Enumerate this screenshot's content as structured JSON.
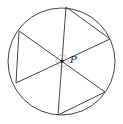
{
  "diagram": {
    "type": "geometry",
    "circle": {
      "cx": 61.5,
      "cy": 61.5,
      "r": 53.5
    },
    "point_p": {
      "x": 62,
      "y": 61,
      "label": "P"
    },
    "angle_marker": {
      "cx": 62,
      "cy": 61,
      "r": 6
    },
    "endpoints": {
      "A": {
        "x": 66,
        "y": 7
      },
      "B": {
        "x": 110,
        "y": 39
      },
      "C": {
        "x": 105,
        "y": 92
      },
      "D": {
        "x": 58,
        "y": 115
      },
      "E": {
        "x": 16,
        "y": 83
      },
      "F": {
        "x": 19,
        "y": 31
      }
    },
    "chords_through_p": [
      {
        "from": "A",
        "to": "D"
      },
      {
        "from": "F",
        "to": "C"
      },
      {
        "from": "E",
        "to": "B"
      }
    ],
    "side_chords": [
      {
        "from": "A",
        "to": "B"
      },
      {
        "from": "F",
        "to": "E"
      },
      {
        "from": "D",
        "to": "C"
      }
    ],
    "colors": {
      "stroke": "#444444",
      "marker": "#999999",
      "background": "#ffffff"
    }
  }
}
